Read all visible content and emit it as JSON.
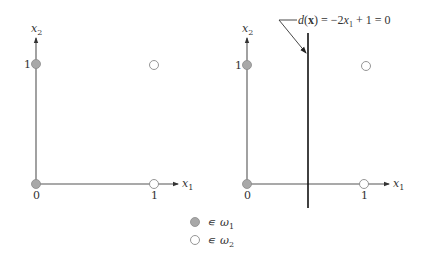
{
  "colors": {
    "class1_fill": "#a8a8a8",
    "class1_stroke": "#8a8a8a",
    "class2_fill": "#ffffff",
    "class2_stroke": "#8a8a8a",
    "axis": "#555555",
    "boundary": "#111111"
  },
  "left_plot": {
    "x_axis_label": "x",
    "x_axis_sub": "1",
    "y_axis_label": "x",
    "y_axis_sub": "2",
    "tick_x0": "0",
    "tick_x1": "1",
    "tick_y1": "1",
    "points": [
      {
        "x1": 0,
        "x2": 0,
        "class": "ω1"
      },
      {
        "x1": 0,
        "x2": 1,
        "class": "ω1"
      },
      {
        "x1": 1,
        "x2": 0,
        "class": "ω2"
      },
      {
        "x1": 1,
        "x2": 1,
        "class": "ω2"
      }
    ]
  },
  "right_plot": {
    "x_axis_label": "x",
    "x_axis_sub": "1",
    "y_axis_label": "x",
    "y_axis_sub": "2",
    "tick_x0": "0",
    "tick_x1": "1",
    "tick_y1": "1",
    "boundary_label": {
      "d": "d",
      "open": "(",
      "x_bold": "x",
      "close": ")",
      "eq1": " = −2",
      "x": "x",
      "sub": "1",
      "rest": " + 1 = 0"
    },
    "boundary_x1": 0.5,
    "points": [
      {
        "x1": 0,
        "x2": 0,
        "class": "ω1"
      },
      {
        "x1": 0,
        "x2": 1,
        "class": "ω1"
      },
      {
        "x1": 1,
        "x2": 0,
        "class": "ω2"
      },
      {
        "x1": 1,
        "x2": 1,
        "class": "ω2"
      }
    ]
  },
  "legend": [
    {
      "symbol": "∊",
      "class": "ω",
      "sub": "1",
      "style": "filled"
    },
    {
      "symbol": "∊",
      "class": "ω",
      "sub": "2",
      "style": "open"
    }
  ]
}
